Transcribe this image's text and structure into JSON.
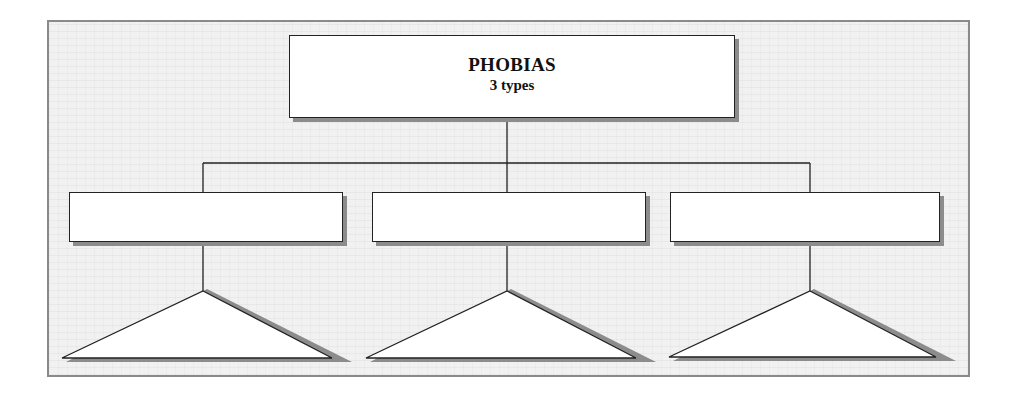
{
  "diagram": {
    "root": {
      "title": "PHOBIAS",
      "subtitle": "3 types"
    },
    "children": [
      {
        "label": "",
        "triangle_label": ""
      },
      {
        "label": "",
        "triangle_label": ""
      },
      {
        "label": "",
        "triangle_label": ""
      }
    ],
    "colors": {
      "background": "#f1f1f1",
      "frame_border": "#8a8a8a",
      "box_fill": "#ffffff",
      "line": "#222222",
      "shadow": "#8c8c8c"
    }
  }
}
